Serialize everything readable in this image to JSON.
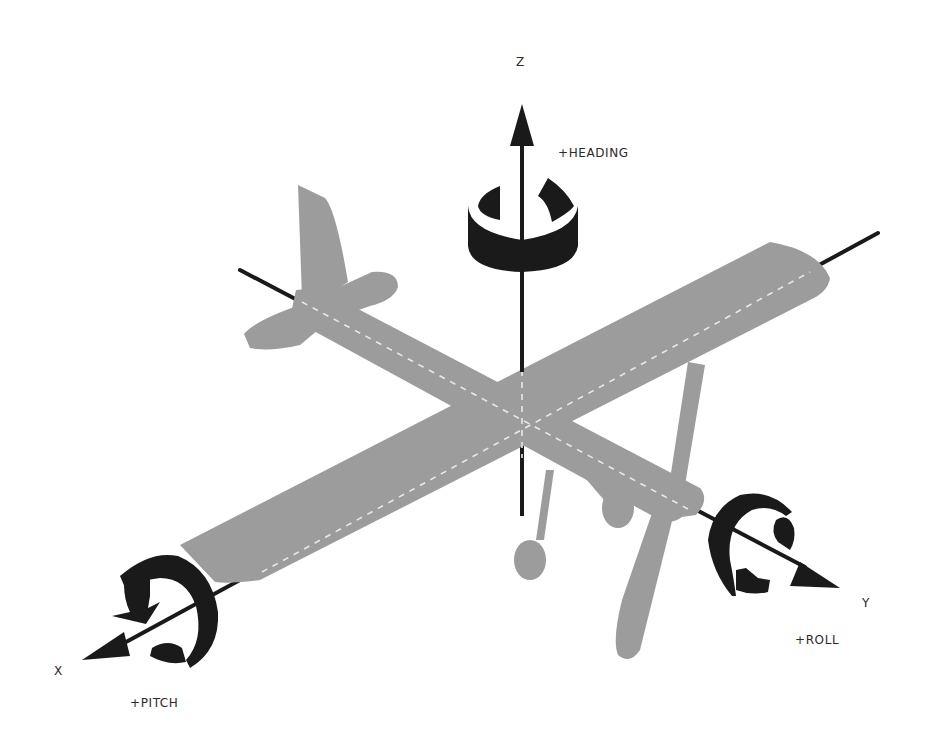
{
  "diagram": {
    "colors": {
      "aircraft": "#9c9c9c",
      "axis": "#1a1a1a",
      "dash": "#e8e8e8",
      "background": "#ffffff"
    },
    "axes": [
      {
        "name": "Z",
        "label": "Z",
        "rotation_label": "+HEADING"
      },
      {
        "name": "X",
        "label": "X",
        "rotation_label": "+PITCH"
      },
      {
        "name": "Y",
        "label": "Y",
        "rotation_label": "+ROLL"
      }
    ]
  }
}
